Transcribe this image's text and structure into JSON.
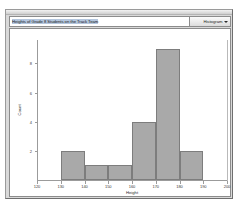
{
  "window": {
    "titlebar_name": "window-titlebar"
  },
  "toolbar": {
    "chart_title_value": "Heights of Grade 8 Students on the Track Team",
    "chart_type_selected": "Histogram",
    "chart_type_options": [
      "Histogram"
    ],
    "caret_icon": "chevron-down-icon"
  },
  "colors": {
    "bar_fill": "#a9a9a9",
    "bar_stroke": "#7d7d7d",
    "axis": "#9b9b9b",
    "panel_bg": "#ffffff",
    "window_bg": "#d9d9d9"
  },
  "chart_data": {
    "type": "bar",
    "title": "Heights of Grade 8 Students on the Track Team",
    "xlabel": "Height",
    "ylabel": "Count",
    "grid": false,
    "legend": false,
    "xlim": [
      120,
      200
    ],
    "ylim": [
      0,
      9.6
    ],
    "xticks": [
      120,
      130,
      140,
      150,
      160,
      170,
      180,
      190,
      200
    ],
    "yticks": [
      2,
      4,
      6,
      8
    ],
    "bin_width": 10,
    "bin_edges": [
      130,
      140,
      150,
      160,
      170,
      180,
      190
    ],
    "categories": [
      "130-140",
      "140-150",
      "150-160",
      "160-170",
      "170-180",
      "180-190"
    ],
    "values": [
      2,
      1,
      1,
      4,
      9,
      2
    ],
    "bars": [
      {
        "left": 130,
        "right": 140,
        "count": 2
      },
      {
        "left": 140,
        "right": 150,
        "count": 1
      },
      {
        "left": 150,
        "right": 160,
        "count": 1
      },
      {
        "left": 160,
        "right": 170,
        "count": 4
      },
      {
        "left": 170,
        "right": 180,
        "count": 9
      },
      {
        "left": 180,
        "right": 190,
        "count": 2
      }
    ]
  }
}
